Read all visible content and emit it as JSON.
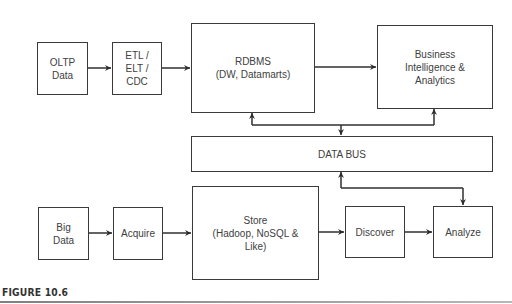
{
  "diagram": {
    "nodes": {
      "oltp_data": "OLTP\nData",
      "etl": "ETL /\nELT /\nCDC",
      "rdbms": "RDBMS\n(DW, Datamarts)",
      "bi_analytics": "Business\nIntelligence &\nAnalytics",
      "data_bus": "DATA BUS",
      "big_data": "Big\nData",
      "acquire": "Acquire",
      "store": "Store\n(Hadoop, NoSQL &\nLike)",
      "discover": "Discover",
      "analyze": "Analyze"
    },
    "edges": [
      {
        "from": "OLTP Data",
        "to": "ETL / ELT / CDC"
      },
      {
        "from": "ETL / ELT / CDC",
        "to": "RDBMS"
      },
      {
        "from": "RDBMS",
        "to": "Business Intelligence & Analytics"
      },
      {
        "from": "DATA BUS",
        "to": "RDBMS"
      },
      {
        "from": "DATA BUS",
        "to": "Business Intelligence & Analytics"
      },
      {
        "from": "RDBMS / BI",
        "to": "DATA BUS"
      },
      {
        "from": "Big Data",
        "to": "Acquire"
      },
      {
        "from": "Acquire",
        "to": "Store"
      },
      {
        "from": "Store",
        "to": "Discover"
      },
      {
        "from": "Discover",
        "to": "Analyze"
      },
      {
        "from": "Analyze",
        "to": "DATA BUS"
      },
      {
        "from": "DATA BUS",
        "to": "Analyze"
      }
    ]
  },
  "caption": "FIGURE 10.6",
  "colors": {
    "stroke": "#3a3a3a",
    "text": "#404040"
  }
}
